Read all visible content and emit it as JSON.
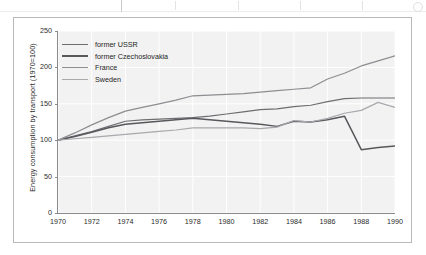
{
  "chart_data": {
    "type": "line",
    "title": "",
    "subtitle": "",
    "xlabel": "",
    "ylabel": "Energy consumption by transport (1970=100)",
    "xlim": [
      1970,
      1990
    ],
    "ylim": [
      0,
      250
    ],
    "ytick_labels": [
      "250",
      "200",
      "150",
      "100",
      "50",
      "0"
    ],
    "ytick_values": [
      250,
      200,
      150,
      100,
      50,
      0
    ],
    "xtick_labels": [
      "1970",
      "1972",
      "1974",
      "1976",
      "1978",
      "1980",
      "1982",
      "1984",
      "1986",
      "1988",
      "1990"
    ],
    "xtick_values": [
      1970,
      1972,
      1974,
      1976,
      1978,
      1980,
      1982,
      1984,
      1986,
      1988,
      1990
    ],
    "grid": true,
    "grid_color": "#ffffff",
    "plot_background": "#f2f2f2",
    "legend_position": "top-left",
    "x": [
      1970,
      1971,
      1972,
      1973,
      1974,
      1975,
      1976,
      1977,
      1978,
      1979,
      1980,
      1981,
      1982,
      1983,
      1984,
      1985,
      1986,
      1987,
      1988,
      1989,
      1990
    ],
    "series": [
      {
        "name": "former USSR",
        "color": "#6e6e72",
        "values": [
          100,
          106,
          112,
          119,
          126,
          128,
          129,
          130,
          131,
          133,
          136,
          139,
          142,
          143,
          146,
          148,
          153,
          157,
          158,
          158,
          158
        ]
      },
      {
        "name": "former Czechoslovakia",
        "color": "#58585c",
        "values": [
          100,
          105,
          111,
          117,
          122,
          124,
          126,
          128,
          130,
          128,
          126,
          124,
          122,
          119,
          126,
          125,
          128,
          133,
          87,
          90,
          92
        ]
      },
      {
        "name": "France",
        "color": "#8d8d92",
        "values": [
          100,
          110,
          121,
          131,
          140,
          145,
          150,
          155,
          161,
          162,
          163,
          164,
          166,
          168,
          170,
          172,
          184,
          192,
          202,
          209,
          216
        ]
      },
      {
        "name": "Sweden",
        "color": "#a8a8ad",
        "values": [
          100,
          102,
          104,
          106,
          108,
          110,
          112,
          114,
          117,
          117,
          117,
          117,
          116,
          118,
          127,
          125,
          130,
          137,
          141,
          152,
          145
        ]
      }
    ]
  },
  "legend": {
    "items": [
      {
        "label": "former USSR"
      },
      {
        "label": "former Czechoslovakia"
      },
      {
        "label": "France"
      },
      {
        "label": "Sweden"
      }
    ]
  }
}
